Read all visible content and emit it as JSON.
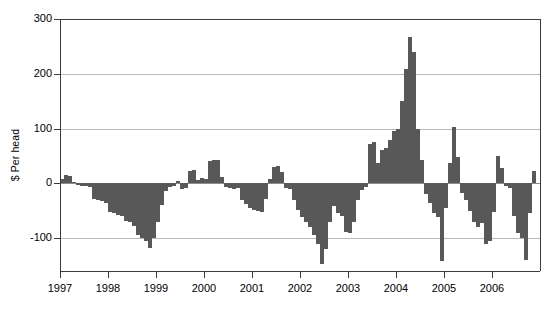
{
  "chart_data": {
    "type": "bar",
    "title": "",
    "subtitle": "",
    "xlabel": "",
    "ylabel": "$ Per head",
    "ylim": [
      -160,
      300
    ],
    "xlim": [
      1997.0,
      2006.95
    ],
    "grid": true,
    "legend": null,
    "bar_color": "#585858",
    "frequency": "monthly",
    "x_start": "1997-01",
    "yticks": [
      300,
      200,
      100,
      0,
      -100
    ],
    "ytick_labels": [
      "300",
      "200",
      "100",
      "0",
      "-100"
    ],
    "xticks": [
      1997,
      1998,
      1999,
      2000,
      2001,
      2002,
      2003,
      2004,
      2005,
      2006
    ],
    "xtick_labels": [
      "1997",
      "1998",
      "1999",
      "2000",
      "2001",
      "2002",
      "2003",
      "2004",
      "2005",
      "2006"
    ],
    "x": [
      "1997-01",
      "1997-02",
      "1997-03",
      "1997-04",
      "1997-05",
      "1997-06",
      "1997-07",
      "1997-08",
      "1997-09",
      "1997-10",
      "1997-11",
      "1997-12",
      "1998-01",
      "1998-02",
      "1998-03",
      "1998-04",
      "1998-05",
      "1998-06",
      "1998-07",
      "1998-08",
      "1998-09",
      "1998-10",
      "1998-11",
      "1998-12",
      "1999-01",
      "1999-02",
      "1999-03",
      "1999-04",
      "1999-05",
      "1999-06",
      "1999-07",
      "1999-08",
      "1999-09",
      "1999-10",
      "1999-11",
      "1999-12",
      "2000-01",
      "2000-02",
      "2000-03",
      "2000-04",
      "2000-05",
      "2000-06",
      "2000-07",
      "2000-08",
      "2000-09",
      "2000-10",
      "2000-11",
      "2000-12",
      "2001-01",
      "2001-02",
      "2001-03",
      "2001-04",
      "2001-05",
      "2001-06",
      "2001-07",
      "2001-08",
      "2001-09",
      "2001-10",
      "2001-11",
      "2001-12",
      "2002-01",
      "2002-02",
      "2002-03",
      "2002-04",
      "2002-05",
      "2002-06",
      "2002-07",
      "2002-08",
      "2002-09",
      "2002-10",
      "2002-11",
      "2002-12",
      "2003-01",
      "2003-02",
      "2003-03",
      "2003-04",
      "2003-05",
      "2003-06",
      "2003-07",
      "2003-08",
      "2003-09",
      "2003-10",
      "2003-11",
      "2003-12",
      "2004-01",
      "2004-02",
      "2004-03",
      "2004-04",
      "2004-05",
      "2004-06",
      "2004-07",
      "2004-08",
      "2004-09",
      "2004-10",
      "2004-11",
      "2004-12",
      "2005-01",
      "2005-02",
      "2005-03",
      "2005-04",
      "2005-05",
      "2005-06",
      "2005-07",
      "2005-08",
      "2005-09",
      "2005-10",
      "2005-11",
      "2005-12",
      "2006-01",
      "2006-02",
      "2006-03",
      "2006-04",
      "2006-05",
      "2006-06",
      "2006-07",
      "2006-08",
      "2006-09",
      "2006-10",
      "2006-11"
    ],
    "values": [
      8,
      16,
      14,
      2,
      -3,
      -4,
      -5,
      -6,
      -28,
      -30,
      -33,
      -35,
      -52,
      -55,
      -58,
      -60,
      -68,
      -70,
      -78,
      -95,
      -100,
      -105,
      -118,
      -100,
      -70,
      -40,
      -14,
      -6,
      -4,
      5,
      -10,
      -8,
      22,
      24,
      6,
      10,
      8,
      40,
      42,
      42,
      12,
      -6,
      -8,
      -10,
      -9,
      -30,
      -38,
      -45,
      -48,
      -50,
      -52,
      -28,
      8,
      30,
      32,
      20,
      -8,
      -10,
      -30,
      -48,
      -62,
      -70,
      -80,
      -95,
      -110,
      -148,
      -120,
      -70,
      -42,
      -55,
      -60,
      -88,
      -90,
      -70,
      -30,
      -12,
      -6,
      72,
      76,
      38,
      60,
      64,
      80,
      96,
      100,
      150,
      208,
      268,
      240,
      100,
      42,
      -20,
      -35,
      -55,
      -62,
      -142,
      -45,
      38,
      102,
      48,
      -18,
      -30,
      -50,
      -70,
      -80,
      -72,
      -110,
      -105,
      -52,
      50,
      28,
      -5,
      -8,
      -60,
      -90,
      -100,
      -140,
      -55,
      22
    ]
  }
}
